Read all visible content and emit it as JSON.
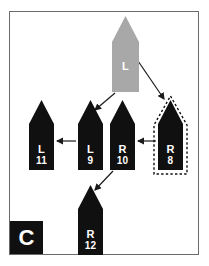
{
  "figure": {
    "panel_tag": "C",
    "background_color": "#ffffff",
    "frame_color": "#6b6b6b"
  },
  "colors": {
    "root_fill": "#a8a8a8",
    "node_fill": "#101010",
    "label_text": "#ffffff",
    "arrow": "#1a1a1a",
    "halo_dash": "#101010"
  },
  "nodes": [
    {
      "id": "root",
      "side": "L",
      "number": "",
      "fill": "#a8a8a8",
      "x": 112,
      "y": 16,
      "w": 27,
      "h": 76,
      "tip": 26,
      "highlighted": false
    },
    {
      "id": "l11",
      "side": "L",
      "number": "11",
      "fill": "#101010",
      "x": 29,
      "y": 100,
      "w": 25,
      "h": 70,
      "tip": 24,
      "highlighted": false
    },
    {
      "id": "l9",
      "side": "L",
      "number": "9",
      "fill": "#101010",
      "x": 78,
      "y": 100,
      "w": 25,
      "h": 70,
      "tip": 24,
      "highlighted": false
    },
    {
      "id": "r10",
      "side": "R",
      "number": "10",
      "fill": "#101010",
      "x": 110,
      "y": 100,
      "w": 25,
      "h": 70,
      "tip": 24,
      "highlighted": false
    },
    {
      "id": "r8",
      "side": "R",
      "number": "8",
      "fill": "#101010",
      "x": 158,
      "y": 100,
      "w": 25,
      "h": 70,
      "tip": 24,
      "highlighted": true
    },
    {
      "id": "r12",
      "side": "R",
      "number": "12",
      "fill": "#101010",
      "x": 78,
      "y": 185,
      "w": 25,
      "h": 70,
      "tip": 24,
      "highlighted": false
    }
  ],
  "arrows": [
    {
      "id": "root-to-l9",
      "from": "root",
      "to": "l9",
      "x1": 115,
      "y1": 93,
      "x2": 95,
      "y2": 110
    },
    {
      "id": "root-to-r8",
      "from": "root",
      "to": "r8",
      "x1": 136,
      "y1": 58,
      "x2": 164,
      "y2": 99
    },
    {
      "id": "l9-to-l11",
      "from": "l9",
      "to": "l11",
      "x1": 76,
      "y1": 141,
      "x2": 57,
      "y2": 141
    },
    {
      "id": "r8-to-r10",
      "from": "r8",
      "to": "r10",
      "x1": 156,
      "y1": 141,
      "x2": 138,
      "y2": 141
    },
    {
      "id": "r10-to-r12",
      "from": "r10",
      "to": "r12",
      "x1": 113,
      "y1": 171,
      "x2": 95,
      "y2": 190
    }
  ]
}
